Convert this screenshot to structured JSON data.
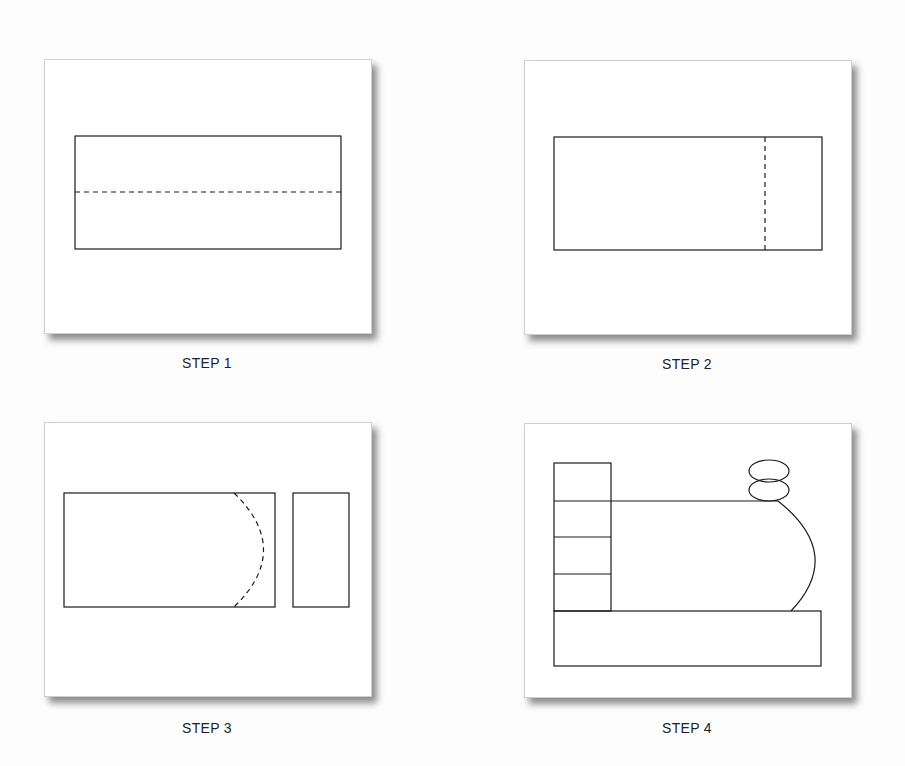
{
  "figure": {
    "panels": [
      {
        "id": "step1",
        "caption": "STEP 1",
        "description": "Rectangle with horizontal dashed fold line through middle"
      },
      {
        "id": "step2",
        "caption": "STEP 2",
        "description": "Rectangle with vertical dashed cut line near right end"
      },
      {
        "id": "step3",
        "caption": "STEP 3",
        "description": "Large rectangle with dashed semicircular cut at right, plus separated small rectangle"
      },
      {
        "id": "step4",
        "caption": "STEP 4",
        "description": "Assembled locomotive: stacked cab blocks, rounded boiler, two oval smokestack pieces, base rectangle"
      }
    ]
  },
  "colors": {
    "line": "#1a1a1a",
    "panel_bg": "#ffffff",
    "page_bg": "#fdfdfd"
  }
}
